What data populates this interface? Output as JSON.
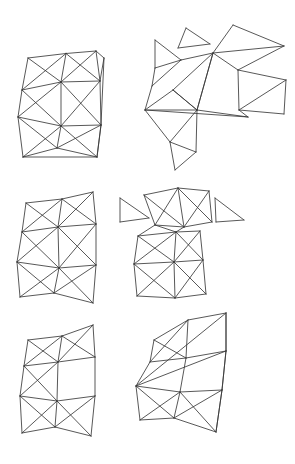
{
  "figure": {
    "background_color": "#ffffff",
    "line_color": "#3a3a3a",
    "line_width": 0.85,
    "canvas_width": 295,
    "canvas_height": 464,
    "panel_count": 6,
    "layout": "3 rows x 2 columns"
  },
  "panels": [
    {
      "id": "panel-top-left",
      "name": "Top-left intact quad mesh",
      "row": 1,
      "column": 1,
      "label": "",
      "vertices": [
        [
          28.0,
          58.0
        ],
        [
          66.0,
          53.5
        ],
        [
          96.0,
          51.0
        ],
        [
          104.0,
          58.0
        ],
        [
          22.0,
          90.0
        ],
        [
          61.0,
          82.0
        ],
        [
          100.0,
          81.0
        ],
        [
          18.0,
          117.0
        ],
        [
          61.0,
          126.0
        ],
        [
          101.0,
          125.0
        ],
        [
          23.0,
          157.0
        ],
        [
          57.0,
          148.0
        ],
        [
          97.0,
          157.0
        ]
      ],
      "edges": [
        [
          0,
          1
        ],
        [
          1,
          2
        ],
        [
          2,
          3
        ],
        [
          0,
          4
        ],
        [
          1,
          5
        ],
        [
          2,
          6
        ],
        [
          3,
          6
        ],
        [
          4,
          5
        ],
        [
          5,
          6
        ],
        [
          0,
          5
        ],
        [
          1,
          4
        ],
        [
          1,
          6
        ],
        [
          2,
          5
        ],
        [
          4,
          7
        ],
        [
          5,
          8
        ],
        [
          6,
          9
        ],
        [
          7,
          8
        ],
        [
          8,
          9
        ],
        [
          4,
          8
        ],
        [
          5,
          7
        ],
        [
          5,
          9
        ],
        [
          6,
          8
        ],
        [
          7,
          10
        ],
        [
          8,
          11
        ],
        [
          9,
          12
        ],
        [
          10,
          11
        ],
        [
          11,
          12
        ],
        [
          7,
          11
        ],
        [
          8,
          10
        ],
        [
          8,
          12
        ],
        [
          9,
          11
        ],
        [
          3,
          9
        ],
        [
          9,
          12
        ],
        [
          10,
          12
        ]
      ]
    },
    {
      "id": "panel-top-right",
      "name": "Top-right exploded / scattered mesh",
      "row": 1,
      "column": 2,
      "label": "",
      "vertices": [
        [
          155.0,
          40.0
        ],
        [
          181.0,
          60.0
        ],
        [
          155.0,
          68.0
        ],
        [
          152.0,
          86.0
        ],
        [
          186.0,
          28.0
        ],
        [
          210.0,
          44.0
        ],
        [
          178.0,
          48.0
        ],
        [
          233.0,
          25.0
        ],
        [
          284.0,
          46.0
        ],
        [
          213.0,
          53.0
        ],
        [
          238.0,
          70.0
        ],
        [
          286.0,
          80.0
        ],
        [
          239.0,
          110.0
        ],
        [
          284.0,
          114.0
        ],
        [
          145.0,
          110.0
        ],
        [
          173.0,
          90.0
        ],
        [
          197.0,
          110.0
        ],
        [
          170.0,
          142.0
        ],
        [
          196.0,
          152.0
        ],
        [
          175.0,
          170.0
        ],
        [
          248.0,
          117.0
        ]
      ],
      "edges": [
        [
          0,
          1
        ],
        [
          1,
          2
        ],
        [
          2,
          0
        ],
        [
          2,
          3
        ],
        [
          1,
          3
        ],
        [
          4,
          5
        ],
        [
          5,
          6
        ],
        [
          6,
          4
        ],
        [
          7,
          8
        ],
        [
          8,
          9
        ],
        [
          9,
          7
        ],
        [
          9,
          10
        ],
        [
          10,
          8
        ],
        [
          10,
          11
        ],
        [
          11,
          12
        ],
        [
          12,
          10
        ],
        [
          12,
          13
        ],
        [
          13,
          11
        ],
        [
          14,
          15
        ],
        [
          15,
          16
        ],
        [
          16,
          14
        ],
        [
          15,
          9
        ],
        [
          16,
          9
        ],
        [
          14,
          17
        ],
        [
          17,
          16
        ],
        [
          16,
          15
        ],
        [
          17,
          18
        ],
        [
          18,
          16
        ],
        [
          18,
          19
        ],
        [
          19,
          17
        ],
        [
          16,
          20
        ],
        [
          20,
          12
        ],
        [
          14,
          20
        ],
        [
          3,
          14
        ],
        [
          9,
          16
        ],
        [
          1,
          9
        ]
      ]
    },
    {
      "id": "panel-middle-left",
      "name": "Middle-left quad mesh",
      "row": 2,
      "column": 1,
      "label": "",
      "vertices": [
        [
          26.0,
          203.0
        ],
        [
          62.0,
          199.0
        ],
        [
          93.0,
          192.0
        ],
        [
          22.0,
          232.0
        ],
        [
          58.0,
          227.0
        ],
        [
          96.0,
          224.0
        ],
        [
          17.0,
          262.0
        ],
        [
          59.0,
          268.0
        ],
        [
          96.0,
          265.0
        ],
        [
          20.0,
          297.0
        ],
        [
          54.0,
          293.0
        ],
        [
          93.0,
          303.0
        ]
      ],
      "edges": [
        [
          0,
          1
        ],
        [
          1,
          2
        ],
        [
          0,
          3
        ],
        [
          1,
          4
        ],
        [
          2,
          5
        ],
        [
          3,
          4
        ],
        [
          4,
          5
        ],
        [
          0,
          4
        ],
        [
          1,
          3
        ],
        [
          1,
          5
        ],
        [
          2,
          4
        ],
        [
          3,
          6
        ],
        [
          4,
          7
        ],
        [
          5,
          8
        ],
        [
          6,
          7
        ],
        [
          7,
          8
        ],
        [
          3,
          7
        ],
        [
          4,
          6
        ],
        [
          4,
          8
        ],
        [
          5,
          7
        ],
        [
          6,
          9
        ],
        [
          7,
          10
        ],
        [
          8,
          11
        ],
        [
          9,
          10
        ],
        [
          10,
          11
        ],
        [
          6,
          10
        ],
        [
          7,
          9
        ],
        [
          7,
          11
        ],
        [
          8,
          10
        ]
      ]
    },
    {
      "id": "panel-middle-right",
      "name": "Middle-right partly separated mesh",
      "row": 2,
      "column": 2,
      "label": "",
      "vertices": [
        [
          120.0,
          198.0
        ],
        [
          149.0,
          218.0
        ],
        [
          120.0,
          222.0
        ],
        [
          215.0,
          198.0
        ],
        [
          244.0,
          220.0
        ],
        [
          216.0,
          222.0
        ],
        [
          144.0,
          195.0
        ],
        [
          178.0,
          188.0
        ],
        [
          209.0,
          191.0
        ],
        [
          155.0,
          225.0
        ],
        [
          184.0,
          227.0
        ],
        [
          212.0,
          222.0
        ],
        [
          138.0,
          236.0
        ],
        [
          176.0,
          232.0
        ],
        [
          200.0,
          231.0
        ],
        [
          134.0,
          264.0
        ],
        [
          174.0,
          262.0
        ],
        [
          203.0,
          260.0
        ],
        [
          137.0,
          296.0
        ],
        [
          175.0,
          298.0
        ],
        [
          206.0,
          294.0
        ]
      ],
      "edges": [
        [
          0,
          1
        ],
        [
          1,
          2
        ],
        [
          2,
          0
        ],
        [
          3,
          4
        ],
        [
          4,
          5
        ],
        [
          5,
          3
        ],
        [
          6,
          7
        ],
        [
          7,
          8
        ],
        [
          6,
          9
        ],
        [
          7,
          10
        ],
        [
          8,
          11
        ],
        [
          9,
          10
        ],
        [
          10,
          11
        ],
        [
          6,
          10
        ],
        [
          7,
          9
        ],
        [
          7,
          11
        ],
        [
          8,
          10
        ],
        [
          12,
          13
        ],
        [
          13,
          14
        ],
        [
          12,
          15
        ],
        [
          13,
          16
        ],
        [
          14,
          17
        ],
        [
          15,
          16
        ],
        [
          16,
          17
        ],
        [
          12,
          16
        ],
        [
          13,
          15
        ],
        [
          13,
          17
        ],
        [
          14,
          16
        ],
        [
          15,
          18
        ],
        [
          16,
          19
        ],
        [
          17,
          20
        ],
        [
          18,
          19
        ],
        [
          19,
          20
        ],
        [
          15,
          19
        ],
        [
          16,
          18
        ],
        [
          16,
          20
        ],
        [
          17,
          19
        ],
        [
          9,
          12
        ],
        [
          9,
          13
        ],
        [
          10,
          13
        ]
      ]
    },
    {
      "id": "panel-bottom-left",
      "name": "Bottom-left quad mesh",
      "row": 3,
      "column": 1,
      "label": "",
      "vertices": [
        [
          28.0,
          340.0
        ],
        [
          62.0,
          336.0
        ],
        [
          93.0,
          325.0
        ],
        [
          24.0,
          366.0
        ],
        [
          58.0,
          362.0
        ],
        [
          95.0,
          357.0
        ],
        [
          20.0,
          396.0
        ],
        [
          57.0,
          401.0
        ],
        [
          95.0,
          396.0
        ],
        [
          22.0,
          433.0
        ],
        [
          55.0,
          427.0
        ],
        [
          91.0,
          436.0
        ]
      ],
      "edges": [
        [
          0,
          1
        ],
        [
          1,
          2
        ],
        [
          0,
          3
        ],
        [
          1,
          4
        ],
        [
          2,
          5
        ],
        [
          3,
          4
        ],
        [
          4,
          5
        ],
        [
          0,
          4
        ],
        [
          1,
          3
        ],
        [
          1,
          5
        ],
        [
          2,
          4
        ],
        [
          3,
          6
        ],
        [
          4,
          7
        ],
        [
          5,
          8
        ],
        [
          6,
          7
        ],
        [
          7,
          8
        ],
        [
          3,
          7
        ],
        [
          4,
          6
        ],
        [
          6,
          9
        ],
        [
          7,
          10
        ],
        [
          8,
          11
        ],
        [
          9,
          10
        ],
        [
          10,
          11
        ],
        [
          6,
          10
        ],
        [
          7,
          9
        ],
        [
          7,
          11
        ],
        [
          8,
          10
        ]
      ]
    },
    {
      "id": "panel-bottom-right",
      "name": "Bottom-right folded mesh",
      "row": 3,
      "column": 2,
      "label": "",
      "vertices": [
        [
          154.0,
          340.0
        ],
        [
          188.0,
          320.0
        ],
        [
          226.0,
          313.0
        ],
        [
          150.0,
          362.0
        ],
        [
          186.0,
          358.0
        ],
        [
          226.0,
          351.0
        ],
        [
          136.0,
          386.0
        ],
        [
          180.0,
          392.0
        ],
        [
          222.0,
          390.0
        ],
        [
          140.0,
          420.0
        ],
        [
          174.0,
          418.0
        ],
        [
          216.0,
          432.0
        ]
      ],
      "edges": [
        [
          0,
          1
        ],
        [
          1,
          2
        ],
        [
          0,
          3
        ],
        [
          1,
          4
        ],
        [
          2,
          5
        ],
        [
          3,
          4
        ],
        [
          4,
          5
        ],
        [
          0,
          4
        ],
        [
          1,
          3
        ],
        [
          3,
          6
        ],
        [
          4,
          7
        ],
        [
          5,
          8
        ],
        [
          6,
          7
        ],
        [
          7,
          8
        ],
        [
          6,
          2
        ],
        [
          6,
          5
        ],
        [
          6,
          9
        ],
        [
          7,
          10
        ],
        [
          8,
          11
        ],
        [
          9,
          10
        ],
        [
          10,
          11
        ],
        [
          6,
          10
        ],
        [
          7,
          9
        ],
        [
          7,
          11
        ],
        [
          8,
          10
        ],
        [
          2,
          5
        ],
        [
          5,
          8
        ],
        [
          8,
          11
        ]
      ]
    }
  ]
}
